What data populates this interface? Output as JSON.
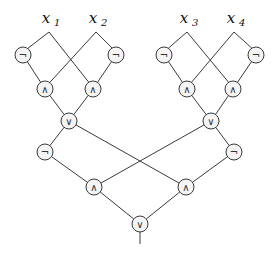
{
  "diagram": {
    "type": "boolean-circuit",
    "inputs": [
      {
        "id": "x1",
        "name": "x",
        "sub": "1",
        "x": 49,
        "y": 19
      },
      {
        "id": "x2",
        "name": "x",
        "sub": "2",
        "x": 96,
        "y": 19
      },
      {
        "id": "x3",
        "name": "x",
        "sub": "3",
        "x": 187,
        "y": 19
      },
      {
        "id": "x4",
        "name": "x",
        "sub": "4",
        "x": 234,
        "y": 19
      }
    ],
    "gates": [
      {
        "id": "n1",
        "op": "¬",
        "x": 23,
        "y": 55
      },
      {
        "id": "n2",
        "op": "¬",
        "x": 116,
        "y": 55
      },
      {
        "id": "a1",
        "op": "∧",
        "x": 45,
        "y": 89
      },
      {
        "id": "a2",
        "op": "∧",
        "x": 93,
        "y": 89
      },
      {
        "id": "o1",
        "op": "∨",
        "x": 69,
        "y": 121
      },
      {
        "id": "n3",
        "op": "¬",
        "x": 164,
        "y": 55
      },
      {
        "id": "n4",
        "op": "¬",
        "x": 256,
        "y": 55
      },
      {
        "id": "a3",
        "op": "∧",
        "x": 187,
        "y": 89
      },
      {
        "id": "a4",
        "op": "∧",
        "x": 233,
        "y": 89
      },
      {
        "id": "o2",
        "op": "∨",
        "x": 211,
        "y": 121
      },
      {
        "id": "n5",
        "op": "¬",
        "x": 45,
        "y": 152
      },
      {
        "id": "n6",
        "op": "¬",
        "x": 234,
        "y": 152
      },
      {
        "id": "a5",
        "op": "∧",
        "x": 94,
        "y": 187
      },
      {
        "id": "a6",
        "op": "∧",
        "x": 186,
        "y": 187
      },
      {
        "id": "o3",
        "op": "∨",
        "x": 140,
        "y": 224
      }
    ],
    "edges": [
      [
        "x1",
        "n1"
      ],
      [
        "x1",
        "a2"
      ],
      [
        "x2",
        "a1"
      ],
      [
        "x2",
        "n2"
      ],
      [
        "n1",
        "a1"
      ],
      [
        "n2",
        "a2"
      ],
      [
        "a1",
        "o1"
      ],
      [
        "a2",
        "o1"
      ],
      [
        "x3",
        "n3"
      ],
      [
        "x3",
        "a4"
      ],
      [
        "x4",
        "a3"
      ],
      [
        "x4",
        "n4"
      ],
      [
        "n3",
        "a3"
      ],
      [
        "n4",
        "a4"
      ],
      [
        "a3",
        "o2"
      ],
      [
        "a4",
        "o2"
      ],
      [
        "o1",
        "n5"
      ],
      [
        "o1",
        "a6"
      ],
      [
        "o2",
        "a5"
      ],
      [
        "o2",
        "n6"
      ],
      [
        "n5",
        "a5"
      ],
      [
        "n6",
        "a6"
      ],
      [
        "a5",
        "o3"
      ],
      [
        "a6",
        "o3"
      ]
    ],
    "output": {
      "from": "o3",
      "x": 140,
      "y": 244
    }
  }
}
